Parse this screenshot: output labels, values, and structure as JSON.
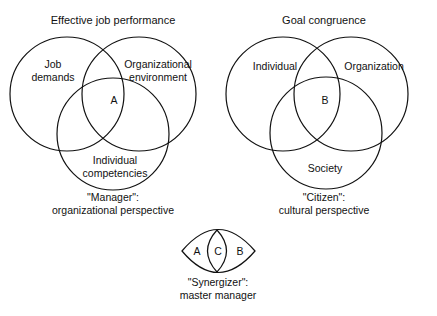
{
  "diagrams": {
    "manager": {
      "title": "Effective job performance",
      "circles": [
        "Job demands",
        "Organizational environment",
        "Individual competencies"
      ],
      "label_job_line1": "Job",
      "label_job_line2": "demands",
      "label_org_line1": "Organizational",
      "label_org_line2": "environment",
      "label_ind_line1": "Individual",
      "label_ind_line2": "competencies",
      "intersection": "A",
      "caption_line1": "\"Manager\":",
      "caption_line2": "organizational perspective"
    },
    "citizen": {
      "title": "Goal congruence",
      "label_individual": "Individual",
      "label_organization": "Organization",
      "label_society": "Society",
      "intersection": "B",
      "caption_line1": "\"Citizen\":",
      "caption_line2": "cultural perspective"
    },
    "synergizer": {
      "left": "A",
      "center": "C",
      "right": "B",
      "caption_line1": "\"Synergizer\":",
      "caption_line2": "master manager"
    }
  },
  "colors": {
    "stroke": "#111111",
    "background": "#ffffff"
  }
}
